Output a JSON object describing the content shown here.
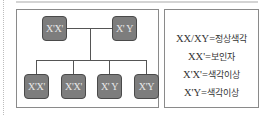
{
  "pedigree": {
    "parents": [
      {
        "genotype": "X'X'"
      },
      {
        "genotype": "X' Y"
      }
    ],
    "children": [
      {
        "genotype": "X'X'"
      },
      {
        "genotype": "X'X'"
      },
      {
        "genotype": "X' Y"
      },
      {
        "genotype": "X'Y"
      }
    ]
  },
  "legend": {
    "items": [
      {
        "key": "XX/XY",
        "eq": "=",
        "value": "정상색각"
      },
      {
        "key": "XX'",
        "eq": "=",
        "value": "보인자"
      },
      {
        "key": "X'X'",
        "eq": "=",
        "value": "색각이상"
      },
      {
        "key": "X'Y",
        "eq": "=",
        "value": "색각이상"
      }
    ]
  },
  "colors": {
    "box_fill": "#7d7d7d",
    "box_border": "#4a4a4a",
    "line": "#555555",
    "panel_border": "#8a8a8a"
  }
}
